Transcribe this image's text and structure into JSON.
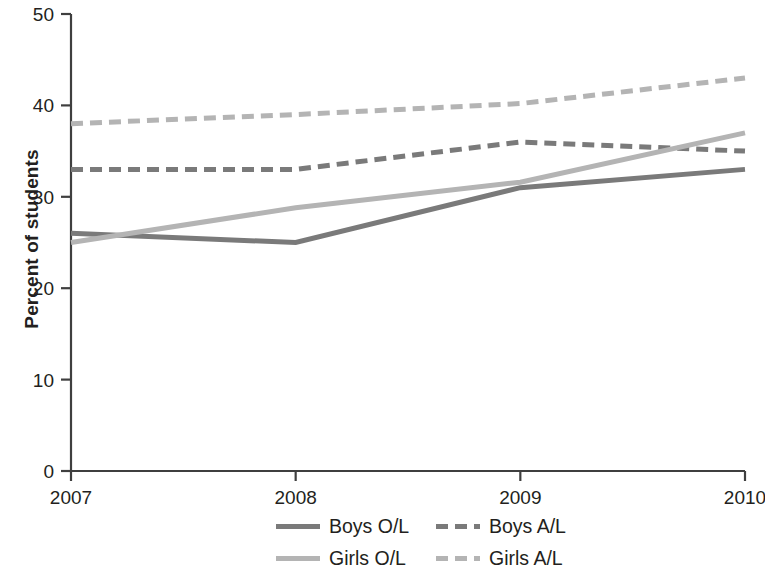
{
  "chart_data": {
    "type": "line",
    "title": "",
    "subtitle": "",
    "xlabel": "",
    "ylabel": "Percent of students",
    "categories": [
      "2007",
      "2008",
      "2009",
      "2010"
    ],
    "x": [
      2007,
      2008,
      2009,
      2010
    ],
    "xlim": [
      2007,
      2010
    ],
    "ylim": [
      0,
      50
    ],
    "y_ticks": [
      0,
      10,
      20,
      30,
      40,
      50
    ],
    "x_ticks": [
      "2007",
      "2008",
      "2009",
      "2010"
    ],
    "grid": false,
    "legend_position": "bottom",
    "series": [
      {
        "name": "Boys O/L",
        "values": [
          26,
          25,
          31,
          33
        ],
        "color": "#7a7a7a",
        "style": "solid",
        "width": 5
      },
      {
        "name": "Boys A/L",
        "values": [
          33,
          33,
          36,
          35
        ],
        "color": "#7a7a7a",
        "style": "dashed",
        "width": 5
      },
      {
        "name": "Girls O/L",
        "values": [
          25,
          28.8,
          31.6,
          37
        ],
        "color": "#b4b4b4",
        "style": "solid",
        "width": 5
      },
      {
        "name": "Girls A/L",
        "values": [
          38,
          39,
          40.2,
          43
        ],
        "color": "#b4b4b4",
        "style": "dashed",
        "width": 5
      }
    ]
  },
  "axes": {
    "y_title": "Percent of students",
    "y_tick_labels": [
      "50",
      "40",
      "30",
      "20",
      "10",
      "0"
    ],
    "x_tick_labels": [
      "2007",
      "2008",
      "2009",
      "2010"
    ]
  },
  "legend": {
    "items": [
      {
        "label": "Boys O/L",
        "color": "#7a7a7a",
        "style": "solid"
      },
      {
        "label": "Boys A/L",
        "color": "#7a7a7a",
        "style": "dashed"
      },
      {
        "label": "Girls O/L",
        "color": "#b4b4b4",
        "style": "solid"
      },
      {
        "label": "Girls A/L",
        "color": "#b4b4b4",
        "style": "dashed"
      }
    ]
  },
  "colors": {
    "axis": "#3f3f3f",
    "text": "#231f20",
    "boys": "#7a7a7a",
    "girls": "#b4b4b4",
    "background": "#ffffff"
  }
}
